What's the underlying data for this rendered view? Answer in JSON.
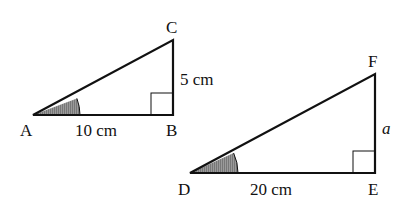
{
  "triangles": [
    {
      "name": "ABC",
      "vertices": {
        "A": "A",
        "B": "B",
        "C": "C"
      },
      "side_AB": "10 cm",
      "side_BC": "5 cm",
      "right_angle_at": "B",
      "shaded_angle_at": "A"
    },
    {
      "name": "DEF",
      "vertices": {
        "D": "D",
        "E": "E",
        "F": "F"
      },
      "side_DE": "20 cm",
      "side_EF": "a",
      "right_angle_at": "E",
      "shaded_angle_at": "D"
    }
  ],
  "colors": {
    "stroke": "#111111",
    "shade": "#888888"
  }
}
